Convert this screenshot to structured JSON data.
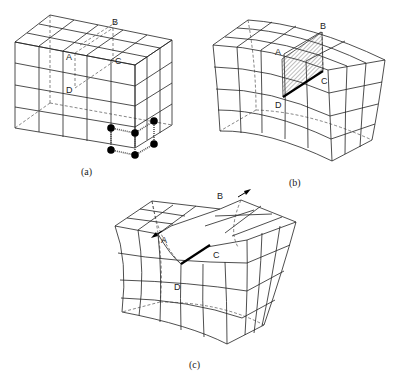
{
  "figure": {
    "panels": [
      {
        "id": "a",
        "caption": "(a)",
        "description": "Undeformed cubic lattice of elements with atoms connected by springs; plane ABCD marked with dashed outline",
        "labels": {
          "A": "A",
          "B": "B",
          "C": "C",
          "D": "D"
        }
      },
      {
        "id": "b",
        "caption": "(b)",
        "description": "Lattice bent with an extra half-plane ABCD (hatched) inserted; dislocation line DC shown bold",
        "labels": {
          "A": "A",
          "B": "B",
          "C": "C",
          "D": "D"
        }
      },
      {
        "id": "c",
        "caption": "(c)",
        "description": "Lattice cut along ABCD with faces displaced in opposite directions (arrows); dislocation line DC shown bold",
        "labels": {
          "A": "A",
          "B": "B",
          "C": "C",
          "D": "D"
        }
      }
    ],
    "colors": {
      "line": "#222222",
      "background": "#ffffff",
      "atom": "#000000"
    }
  }
}
